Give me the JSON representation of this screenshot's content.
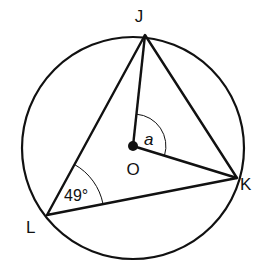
{
  "diagram": {
    "type": "circle-geometry",
    "circle": {
      "center": "O",
      "cx": 133,
      "cy": 148,
      "r": 111
    },
    "points": {
      "J": {
        "label": "J",
        "x": 145,
        "y": 35
      },
      "K": {
        "label": "K",
        "x": 237,
        "y": 178
      },
      "L": {
        "label": "L",
        "x": 47,
        "y": 215
      },
      "O": {
        "label": "O",
        "x": 133,
        "y": 146
      }
    },
    "segments": [
      "JK",
      "KL",
      "LJ",
      "OJ",
      "OK"
    ],
    "angles": [
      {
        "vertex": "L",
        "label": "49°"
      },
      {
        "vertex": "O",
        "label": "a"
      }
    ],
    "colors": {
      "stroke": "#111111",
      "background": "#ffffff"
    }
  }
}
